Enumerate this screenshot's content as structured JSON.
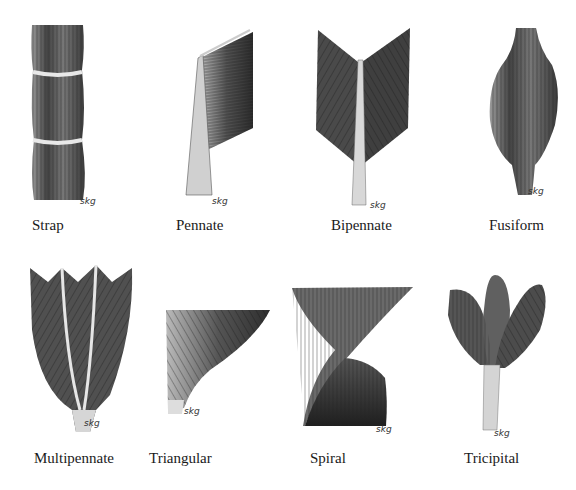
{
  "signature": "skg",
  "muscles": [
    {
      "name": "Strap"
    },
    {
      "name": "Pennate"
    },
    {
      "name": "Bipennate"
    },
    {
      "name": "Fusiform"
    },
    {
      "name": "Multipennate"
    },
    {
      "name": "Triangular"
    },
    {
      "name": "Spiral"
    },
    {
      "name": "Tricipital"
    }
  ]
}
